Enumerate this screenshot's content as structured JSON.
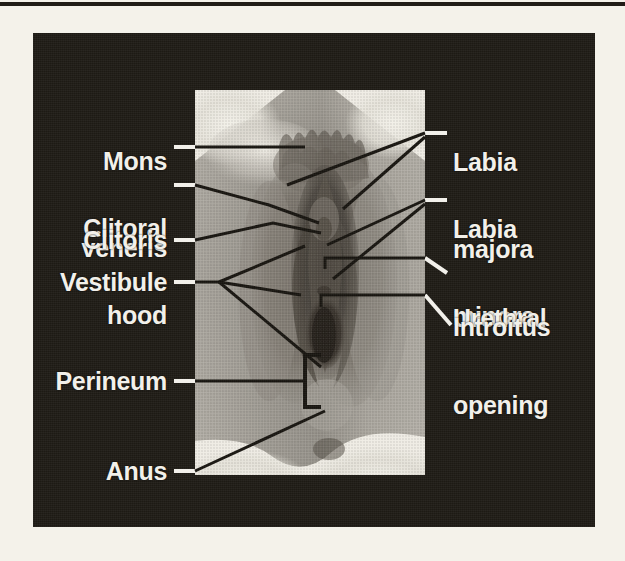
{
  "figure": {
    "type": "labeled-anatomical-photograph",
    "colors": {
      "page_background": "#f4f2ea",
      "panel_background": "#1d1a14",
      "label_text": "#f2f0ea",
      "leader_line_dark": "#17140f",
      "leader_line_light": "#f2f0ea",
      "photo_midtone": "#9e9a92",
      "photo_highlight": "#efece4",
      "photo_shadow": "#413c36",
      "top_rule": "#211d17"
    }
  },
  "labels_left": [
    {
      "id": "mons-veneris",
      "lines": [
        "Mons",
        "veneris"
      ],
      "text": "Mons veneris"
    },
    {
      "id": "clitoral-hood",
      "lines": [
        "Clitoral",
        "hood"
      ],
      "text": "Clitoral hood"
    },
    {
      "id": "clitoris",
      "lines": [
        "Clitoris"
      ],
      "text": "Clitoris"
    },
    {
      "id": "vestibule",
      "lines": [
        "Vestibule"
      ],
      "text": "Vestibule"
    },
    {
      "id": "perineum",
      "lines": [
        "Perineum"
      ],
      "text": "Perineum"
    },
    {
      "id": "anus",
      "lines": [
        "Anus"
      ],
      "text": "Anus"
    }
  ],
  "labels_right": [
    {
      "id": "labia-majora",
      "lines": [
        "Labia",
        "majora"
      ],
      "text": "Labia majora"
    },
    {
      "id": "labia-minora",
      "lines": [
        "Labia",
        "minora"
      ],
      "text": "Labia minora"
    },
    {
      "id": "urethral-opening",
      "lines": [
        "Urethral",
        "opening"
      ],
      "text": "Urethral opening"
    },
    {
      "id": "introitus",
      "lines": [
        "Introitus"
      ],
      "text": "Introitus"
    }
  ],
  "label_text": {
    "mons_l1": "Mons",
    "mons_l2": "veneris",
    "clitoral_l1": "Clitoral",
    "clitoral_l2": "hood",
    "clitoris": "Clitoris",
    "vestibule": "Vestibule",
    "perineum": "Perineum",
    "anus": "Anus",
    "labia_majora_l1": "Labia",
    "labia_majora_l2": "majora",
    "labia_minora_l1": "Labia",
    "labia_minora_l2": "minora",
    "urethral_l1": "Urethral",
    "urethral_l2": "opening",
    "introitus": "Introitus"
  },
  "photo": {
    "name": "vulva-photograph",
    "rect": {
      "x": 162,
      "y": 57,
      "w": 230,
      "h": 385
    },
    "description": "Grayscale halftone clinical photograph of the vulva with white highlighted thighs at the four corners"
  },
  "leader_lines": [
    {
      "id": "mons-veneris-leader",
      "kind": "horizontal"
    },
    {
      "id": "clitoral-hood-leader",
      "kind": "angled"
    },
    {
      "id": "clitoris-leader",
      "kind": "angled"
    },
    {
      "id": "vestibule-leader",
      "kind": "fan-3"
    },
    {
      "id": "perineum-leader",
      "kind": "bracket"
    },
    {
      "id": "anus-leader",
      "kind": "diagonal"
    },
    {
      "id": "labia-majora-leader",
      "kind": "fan-2"
    },
    {
      "id": "labia-minora-leader",
      "kind": "fan-2"
    },
    {
      "id": "urethral-opening-leader",
      "kind": "hooked-horizontal"
    },
    {
      "id": "introitus-leader",
      "kind": "hooked-horizontal"
    }
  ]
}
